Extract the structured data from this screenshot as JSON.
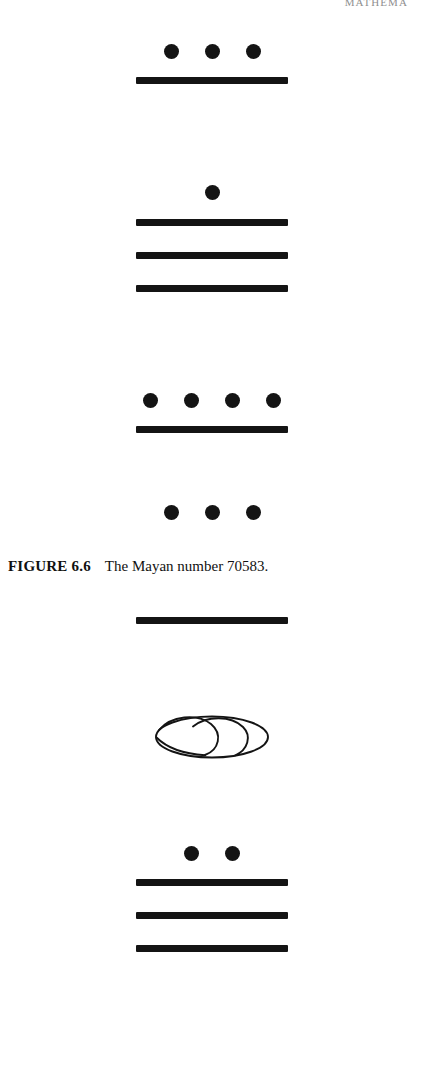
{
  "page": {
    "running_head": "MATHEMA",
    "background_color": "#ffffff",
    "ink_color": "#141414"
  },
  "figure_66": {
    "caption_label": "FIGURE 6.6",
    "caption_text": "The Mayan number 70583.",
    "number_value": "70583",
    "groups": [
      {
        "name": "digit-1",
        "dots": 3,
        "bars": 1,
        "value": 8,
        "shell": false
      },
      {
        "name": "digit-2",
        "dots": 1,
        "bars": 3,
        "value": 16,
        "shell": false
      },
      {
        "name": "digit-3",
        "dots": 4,
        "bars": 1,
        "value": 9,
        "shell": false
      },
      {
        "name": "digit-4",
        "dots": 3,
        "bars": 0,
        "value": 3,
        "shell": false
      }
    ]
  },
  "figure_lower": {
    "groups": [
      {
        "name": "digit-1",
        "dots": 0,
        "bars": 1,
        "value": 5,
        "shell": false
      },
      {
        "name": "digit-2",
        "dots": 0,
        "bars": 0,
        "value": 0,
        "shell": true
      },
      {
        "name": "digit-3",
        "dots": 2,
        "bars": 3,
        "value": 17,
        "shell": false
      }
    ]
  }
}
